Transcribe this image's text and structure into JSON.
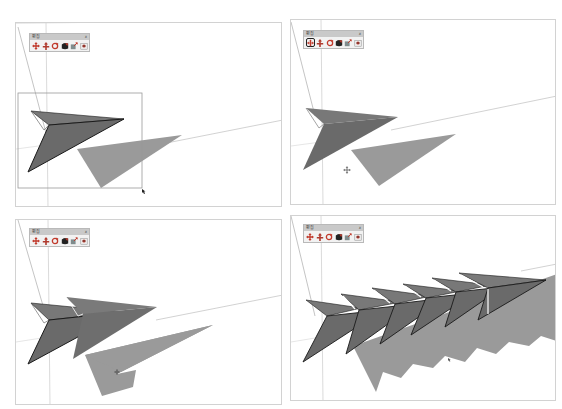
{
  "layout": {
    "rows": 2,
    "cols": 2
  },
  "toolbar": {
    "title": "편집",
    "close_label": "x",
    "icons": [
      {
        "name": "move-icon"
      },
      {
        "name": "push-pull-icon"
      },
      {
        "name": "rotate-icon"
      },
      {
        "name": "follow-me-icon"
      },
      {
        "name": "scale-icon"
      },
      {
        "name": "offset-icon"
      }
    ]
  },
  "panels": [
    {
      "id": "step-1-select",
      "active_tool_index": -1,
      "state": "selection box drawn around arrow",
      "copies": 1
    },
    {
      "id": "step-2-move-tool",
      "active_tool_index": 0,
      "state": "move tool active",
      "copies": 1
    },
    {
      "id": "step-3-copy",
      "active_tool_index": -1,
      "state": "one copy placed",
      "copies": 2
    },
    {
      "id": "step-4-array",
      "active_tool_index": -1,
      "state": "array of copies",
      "copies": 6
    }
  ],
  "colors": {
    "arrow_face": "#6e6e6e",
    "arrow_face_light": "#7a7a7a",
    "shadow": "#9a9a9a",
    "edge": "#1a1a1a",
    "axis_line": "#c8c8c8",
    "frame": "#d2d2d2",
    "toolbar_bg": "#f2f2f2",
    "toolbar_title_bg": "#c9c9c9"
  }
}
